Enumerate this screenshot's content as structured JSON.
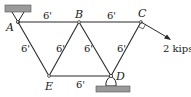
{
  "diagram": {
    "type": "truss",
    "nodes": [
      {
        "id": "A",
        "label": "A"
      },
      {
        "id": "B",
        "label": "B"
      },
      {
        "id": "C",
        "label": "C"
      },
      {
        "id": "D",
        "label": "D"
      },
      {
        "id": "E",
        "label": "E"
      }
    ],
    "members": [
      {
        "from": "A",
        "to": "B",
        "length_label": "6'"
      },
      {
        "from": "B",
        "to": "C",
        "length_label": "6'"
      },
      {
        "from": "A",
        "to": "E",
        "length_label": "6'"
      },
      {
        "from": "E",
        "to": "B",
        "length_label": "6'"
      },
      {
        "from": "B",
        "to": "D",
        "length_label": "6'"
      },
      {
        "from": "E",
        "to": "D",
        "length_label": "6'"
      },
      {
        "from": "C",
        "to": "D",
        "length_label": "6'"
      }
    ],
    "supports": [
      {
        "node": "A",
        "type": "pin",
        "ground": "top"
      },
      {
        "node": "D",
        "type": "pin",
        "ground": "bottom"
      }
    ],
    "load": {
      "node": "C",
      "label": "2 kips",
      "direction": "perpendicular to CD",
      "right_angle_marker": true
    }
  }
}
